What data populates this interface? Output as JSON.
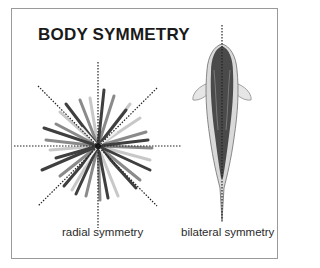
{
  "figure": {
    "title": "BODY SYMMETRY",
    "panels": [
      {
        "id": "radial",
        "label": "radial symmetry",
        "subject": "sea-urchin",
        "axes": 4
      },
      {
        "id": "bilateral",
        "label": "bilateral symmetry",
        "subject": "fish-top-view",
        "axes": 1
      }
    ],
    "colors": {
      "frame": "#9a9a9a",
      "text": "#1a1a1a",
      "axis_line": "#333333",
      "spine_dark": "#3a3a3a",
      "spine_light": "#bdbdbd"
    }
  }
}
